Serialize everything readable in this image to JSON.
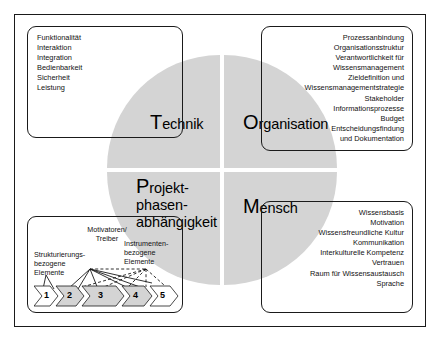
{
  "figure": {
    "accent_gray": "#d4d4d4",
    "line_color": "#1a1a1a"
  },
  "quadrants": {
    "technik": {
      "cap": "T",
      "rest": "echnik"
    },
    "organisation": {
      "cap": "O",
      "rest": "rganisation"
    },
    "projekt": {
      "cap": "P",
      "rest": "rojekt-\nphasen-\nabhängigkeit"
    },
    "mensch": {
      "cap": "M",
      "rest": "ensch"
    }
  },
  "boxes": {
    "technik": {
      "name": "Technik",
      "items": [
        "Funktionalität",
        "Interaktion",
        "Integration",
        "Bedienbarkeit",
        "Sicherheit",
        "Leistung"
      ]
    },
    "organisation": {
      "name": "Organisation",
      "items": [
        "Prozessanbindung",
        "Organisationsstruktur",
        "Verantwortlichkeit für",
        "Wissensmanagement",
        "Zieldefinition und",
        "Wissensmanagementstrategie",
        "Stakeholder",
        "Informationsprozesse",
        "Budget",
        "Entscheidungsfindung",
        "und Dokumentation"
      ]
    },
    "mensch": {
      "name": "Mensch",
      "items": [
        "Wissensbasis",
        "Motivation",
        "Wissensfreundliche Kultur",
        "Kommunikation",
        "Interkulturelle Kompetenz",
        "Vertrauen",
        "Raum für Wissensaustausch",
        "Sprache"
      ]
    },
    "projektphasen": {
      "name": "Projektphasenabhängigkeit",
      "labels": {
        "strukturierung": "Strukturierungs-\nbezogene\nElemente",
        "motivatoren": "Motivatoren/\nTreiber",
        "instrumenten": "Instrumenten-\nbezogene\nElemente"
      },
      "phases": [
        "1",
        "2",
        "3",
        "4",
        "5"
      ]
    }
  }
}
